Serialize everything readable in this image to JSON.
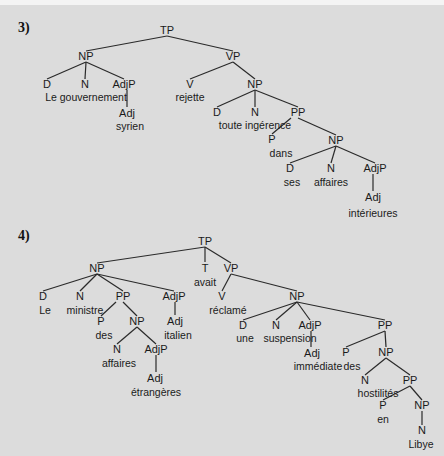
{
  "background": {
    "page": "#f4f4f4",
    "panel": "#dcdcdc",
    "ink": "#1a1a1a"
  },
  "trees": [
    {
      "number": "3)",
      "number_pos": [
        18,
        20
      ],
      "sentence": "Le gouvernement syrien rejette toute ingérence dans ses affaires intérieures",
      "nodes": [
        {
          "id": "tp",
          "label": "TP",
          "x": 167,
          "y": 30,
          "kind": "cat"
        },
        {
          "id": "np1",
          "label": "NP",
          "x": 86,
          "y": 56,
          "kind": "cat"
        },
        {
          "id": "vp",
          "label": "VP",
          "x": 233,
          "y": 56,
          "kind": "cat"
        },
        {
          "id": "d1",
          "label": "D",
          "x": 47,
          "y": 84,
          "kind": "cat"
        },
        {
          "id": "n1",
          "label": "N",
          "x": 85,
          "y": 84,
          "kind": "cat"
        },
        {
          "id": "adjp1",
          "label": "AdjP",
          "x": 124,
          "y": 84,
          "kind": "cat"
        },
        {
          "id": "w_legouv",
          "label": "Le gouvernement",
          "x": 86,
          "y": 97,
          "kind": "word"
        },
        {
          "id": "adj1",
          "label": "Adj",
          "x": 127,
          "y": 113,
          "kind": "cat"
        },
        {
          "id": "w_syrien",
          "label": "syrien",
          "x": 130,
          "y": 126,
          "kind": "word"
        },
        {
          "id": "v1",
          "label": "V",
          "x": 190,
          "y": 84,
          "kind": "cat"
        },
        {
          "id": "w_rejette",
          "label": "rejette",
          "x": 190,
          "y": 97,
          "kind": "word"
        },
        {
          "id": "np2",
          "label": "NP",
          "x": 255,
          "y": 84,
          "kind": "cat"
        },
        {
          "id": "d2",
          "label": "D",
          "x": 217,
          "y": 112,
          "kind": "cat"
        },
        {
          "id": "n2",
          "label": "N",
          "x": 255,
          "y": 112,
          "kind": "cat"
        },
        {
          "id": "pp1",
          "label": "PP",
          "x": 298,
          "y": 112,
          "kind": "cat"
        },
        {
          "id": "w_toute",
          "label": "toute ingérence",
          "x": 255,
          "y": 125,
          "kind": "word"
        },
        {
          "id": "p1",
          "label": "P",
          "x": 272,
          "y": 139,
          "kind": "cat"
        },
        {
          "id": "w_dans",
          "label": "dans",
          "x": 281,
          "y": 153,
          "kind": "word"
        },
        {
          "id": "np3",
          "label": "NP",
          "x": 336,
          "y": 140,
          "kind": "cat"
        },
        {
          "id": "d3",
          "label": "D",
          "x": 290,
          "y": 168,
          "kind": "cat"
        },
        {
          "id": "w_ses",
          "label": "ses",
          "x": 292,
          "y": 182,
          "kind": "word"
        },
        {
          "id": "n3",
          "label": "N",
          "x": 331,
          "y": 168,
          "kind": "cat"
        },
        {
          "id": "w_affaires",
          "label": "affaires",
          "x": 331,
          "y": 182,
          "kind": "word"
        },
        {
          "id": "adjp2",
          "label": "AdjP",
          "x": 375,
          "y": 168,
          "kind": "cat"
        },
        {
          "id": "adj2",
          "label": "Adj",
          "x": 373,
          "y": 197,
          "kind": "cat"
        },
        {
          "id": "w_interieures",
          "label": "intérieures",
          "x": 373,
          "y": 213,
          "kind": "word"
        }
      ],
      "edges": [
        [
          167,
          36,
          86,
          51
        ],
        [
          167,
          36,
          233,
          51
        ],
        [
          86,
          62,
          47,
          79
        ],
        [
          86,
          62,
          85,
          79
        ],
        [
          86,
          62,
          124,
          79
        ],
        [
          127,
          90,
          127,
          107
        ],
        [
          233,
          62,
          190,
          79
        ],
        [
          233,
          62,
          255,
          79
        ],
        [
          255,
          90,
          217,
          107
        ],
        [
          255,
          90,
          255,
          107
        ],
        [
          255,
          90,
          298,
          107
        ],
        [
          291,
          118,
          272,
          134
        ],
        [
          298,
          118,
          336,
          135
        ],
        [
          336,
          146,
          290,
          163
        ],
        [
          336,
          146,
          331,
          163
        ],
        [
          336,
          146,
          375,
          163
        ],
        [
          373,
          174,
          373,
          191
        ]
      ]
    },
    {
      "number": "4)",
      "number_pos": [
        18,
        228
      ],
      "sentence": "Le ministre des affaires étrangères italien avait réclamé une suspension immédiate des hostilités en Libye",
      "nodes": [
        {
          "id": "tp",
          "label": "TP",
          "x": 205,
          "y": 241,
          "kind": "cat"
        },
        {
          "id": "np1",
          "label": "NP",
          "x": 97,
          "y": 268,
          "kind": "cat"
        },
        {
          "id": "t",
          "label": "T",
          "x": 205,
          "y": 268,
          "kind": "cat"
        },
        {
          "id": "w_avait",
          "label": "avait",
          "x": 205,
          "y": 282,
          "kind": "word"
        },
        {
          "id": "vp",
          "label": "VP",
          "x": 231,
          "y": 268,
          "kind": "cat"
        },
        {
          "id": "d1",
          "label": "D",
          "x": 43,
          "y": 296,
          "kind": "cat"
        },
        {
          "id": "w_le",
          "label": "Le",
          "x": 45,
          "y": 310,
          "kind": "word"
        },
        {
          "id": "n1",
          "label": "N",
          "x": 80,
          "y": 296,
          "kind": "cat"
        },
        {
          "id": "w_ministre",
          "label": "ministre",
          "x": 85,
          "y": 310,
          "kind": "word"
        },
        {
          "id": "pp1",
          "label": "PP",
          "x": 123,
          "y": 296,
          "kind": "cat"
        },
        {
          "id": "adjp1",
          "label": "AdjP",
          "x": 174,
          "y": 296,
          "kind": "cat"
        },
        {
          "id": "p1",
          "label": "P",
          "x": 101,
          "y": 321,
          "kind": "cat"
        },
        {
          "id": "w_des1",
          "label": "des",
          "x": 104,
          "y": 335,
          "kind": "word"
        },
        {
          "id": "np2",
          "label": "NP",
          "x": 137,
          "y": 321,
          "kind": "cat"
        },
        {
          "id": "adj1",
          "label": "Adj",
          "x": 175,
          "y": 321,
          "kind": "cat"
        },
        {
          "id": "w_italien",
          "label": "italien",
          "x": 178,
          "y": 335,
          "kind": "word"
        },
        {
          "id": "n2",
          "label": "N",
          "x": 117,
          "y": 349,
          "kind": "cat"
        },
        {
          "id": "w_affaires",
          "label": "affaires",
          "x": 119,
          "y": 363,
          "kind": "word"
        },
        {
          "id": "adjp2",
          "label": "AdjP",
          "x": 156,
          "y": 349,
          "kind": "cat"
        },
        {
          "id": "adj2",
          "label": "Adj",
          "x": 155,
          "y": 378,
          "kind": "cat"
        },
        {
          "id": "w_etrangeres",
          "label": "étrangères",
          "x": 156,
          "y": 392,
          "kind": "word"
        },
        {
          "id": "v",
          "label": "V",
          "x": 222,
          "y": 296,
          "kind": "cat"
        },
        {
          "id": "w_reclame",
          "label": "réclamé",
          "x": 228,
          "y": 310,
          "kind": "word"
        },
        {
          "id": "np3",
          "label": "NP",
          "x": 297,
          "y": 296,
          "kind": "cat"
        },
        {
          "id": "d2",
          "label": "D",
          "x": 243,
          "y": 325,
          "kind": "cat"
        },
        {
          "id": "w_une",
          "label": "une",
          "x": 245,
          "y": 338,
          "kind": "word"
        },
        {
          "id": "n3",
          "label": "N",
          "x": 276,
          "y": 325,
          "kind": "cat"
        },
        {
          "id": "w_suspension",
          "label": "suspension",
          "x": 290,
          "y": 338,
          "kind": "word"
        },
        {
          "id": "adjp3",
          "label": "AdjP",
          "x": 310,
          "y": 325,
          "kind": "cat"
        },
        {
          "id": "adj3",
          "label": "Adj",
          "x": 312,
          "y": 353,
          "kind": "cat"
        },
        {
          "id": "w_immediate",
          "label": "immédiate",
          "x": 318,
          "y": 366,
          "kind": "word"
        },
        {
          "id": "pp2",
          "label": "PP",
          "x": 385,
          "y": 325,
          "kind": "cat"
        },
        {
          "id": "p2",
          "label": "P",
          "x": 346,
          "y": 352,
          "kind": "cat"
        },
        {
          "id": "w_des2",
          "label": "des",
          "x": 352,
          "y": 366,
          "kind": "word"
        },
        {
          "id": "np4",
          "label": "NP",
          "x": 386,
          "y": 352,
          "kind": "cat"
        },
        {
          "id": "n4",
          "label": "N",
          "x": 365,
          "y": 380,
          "kind": "cat"
        },
        {
          "id": "w_hostilites",
          "label": "hostilités",
          "x": 378,
          "y": 393,
          "kind": "word"
        },
        {
          "id": "pp3",
          "label": "PP",
          "x": 410,
          "y": 380,
          "kind": "cat"
        },
        {
          "id": "p3",
          "label": "P",
          "x": 383,
          "y": 405,
          "kind": "cat"
        },
        {
          "id": "w_en",
          "label": "en",
          "x": 383,
          "y": 419,
          "kind": "word"
        },
        {
          "id": "np5",
          "label": "NP",
          "x": 422,
          "y": 405,
          "kind": "cat"
        },
        {
          "id": "n5",
          "label": "N",
          "x": 422,
          "y": 430,
          "kind": "cat"
        },
        {
          "id": "w_libye",
          "label": "Libye",
          "x": 421,
          "y": 444,
          "kind": "word"
        }
      ],
      "edges": [
        [
          205,
          247,
          97,
          263
        ],
        [
          205,
          247,
          205,
          262
        ],
        [
          205,
          247,
          231,
          263
        ],
        [
          97,
          274,
          43,
          291
        ],
        [
          97,
          274,
          80,
          291
        ],
        [
          97,
          274,
          123,
          291
        ],
        [
          97,
          274,
          174,
          291
        ],
        [
          116,
          302,
          101,
          316
        ],
        [
          123,
          302,
          137,
          316
        ],
        [
          175,
          302,
          175,
          315
        ],
        [
          137,
          327,
          117,
          344
        ],
        [
          137,
          327,
          156,
          344
        ],
        [
          156,
          355,
          156,
          372
        ],
        [
          231,
          274,
          222,
          291
        ],
        [
          231,
          274,
          297,
          291
        ],
        [
          297,
          302,
          243,
          320
        ],
        [
          297,
          302,
          276,
          320
        ],
        [
          297,
          302,
          310,
          320
        ],
        [
          297,
          302,
          385,
          320
        ],
        [
          311,
          331,
          311,
          347
        ],
        [
          385,
          331,
          346,
          347
        ],
        [
          385,
          331,
          386,
          347
        ],
        [
          386,
          358,
          365,
          375
        ],
        [
          386,
          358,
          410,
          375
        ],
        [
          410,
          386,
          383,
          400
        ],
        [
          410,
          386,
          422,
          400
        ],
        [
          422,
          411,
          422,
          425
        ]
      ]
    }
  ],
  "footer": {
    "note": "(text cut off at bottom edge)"
  }
}
